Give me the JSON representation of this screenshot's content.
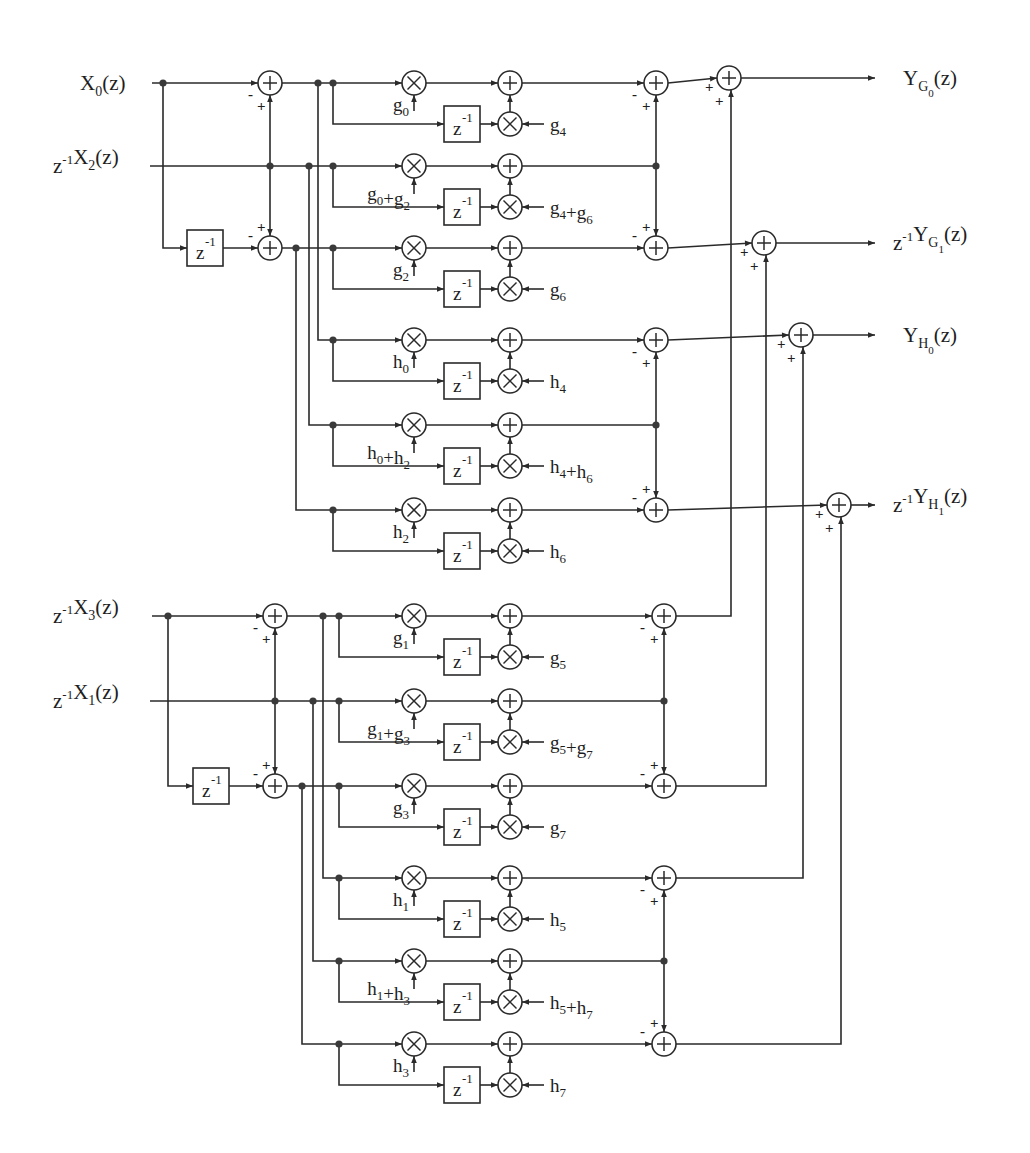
{
  "figure": {
    "type": "signal-flow block diagram"
  },
  "colors": {
    "line": "#2a2a2a",
    "background": "#ffffff",
    "text": "#1e1e1e"
  },
  "symbols": {
    "adder": "+",
    "multiplier": "×",
    "delay": "z",
    "delay_exp": "-1",
    "plus": "+",
    "minus": "-"
  },
  "inputs": [
    {
      "id": "x0",
      "prefix": "",
      "base": "X",
      "sub": "0",
      "suffix": "(z)"
    },
    {
      "id": "x2",
      "prefix": "z",
      "prefix_exp": "-1",
      "base": "X",
      "sub": "2",
      "suffix": "(z)"
    },
    {
      "id": "x3",
      "prefix": "z",
      "prefix_exp": "-1",
      "base": "X",
      "sub": "3",
      "suffix": "(z)"
    },
    {
      "id": "x1",
      "prefix": "z",
      "prefix_exp": "-1",
      "base": "X",
      "sub": "1",
      "suffix": "(z)"
    }
  ],
  "outputs": [
    {
      "id": "yg0",
      "prefix": "",
      "base": "Y",
      "sub": "G",
      "subsub": "0",
      "suffix": "(z)"
    },
    {
      "id": "yg1",
      "prefix": "z",
      "prefix_exp": "-1",
      "base": "Y",
      "sub": "G",
      "subsub": "1",
      "suffix": "(z)"
    },
    {
      "id": "yh0",
      "prefix": "",
      "base": "Y",
      "sub": "H",
      "subsub": "0",
      "suffix": "(z)"
    },
    {
      "id": "yh1",
      "prefix": "z",
      "prefix_exp": "-1",
      "base": "Y",
      "sub": "H",
      "subsub": "1",
      "suffix": "(z)"
    }
  ],
  "sections": [
    {
      "name": "upper",
      "branches": [
        {
          "coef_a": {
            "base": "g",
            "sub": "0"
          },
          "coef_b": {
            "base": "g",
            "sub": "4"
          }
        },
        {
          "coef_a": {
            "terms": [
              {
                "base": "g",
                "sub": "0"
              },
              {
                "base": "g",
                "sub": "2"
              }
            ]
          },
          "coef_b": {
            "terms": [
              {
                "base": "g",
                "sub": "4"
              },
              {
                "base": "g",
                "sub": "6"
              }
            ]
          }
        },
        {
          "coef_a": {
            "base": "g",
            "sub": "2"
          },
          "coef_b": {
            "base": "g",
            "sub": "6"
          }
        },
        {
          "coef_a": {
            "base": "h",
            "sub": "0"
          },
          "coef_b": {
            "base": "h",
            "sub": "4"
          }
        },
        {
          "coef_a": {
            "terms": [
              {
                "base": "h",
                "sub": "0"
              },
              {
                "base": "h",
                "sub": "2"
              }
            ]
          },
          "coef_b": {
            "terms": [
              {
                "base": "h",
                "sub": "4"
              },
              {
                "base": "h",
                "sub": "6"
              }
            ]
          }
        },
        {
          "coef_a": {
            "base": "h",
            "sub": "2"
          },
          "coef_b": {
            "base": "h",
            "sub": "6"
          }
        }
      ]
    },
    {
      "name": "lower",
      "branches": [
        {
          "coef_a": {
            "base": "g",
            "sub": "1"
          },
          "coef_b": {
            "base": "g",
            "sub": "5"
          }
        },
        {
          "coef_a": {
            "terms": [
              {
                "base": "g",
                "sub": "1"
              },
              {
                "base": "g",
                "sub": "3"
              }
            ]
          },
          "coef_b": {
            "terms": [
              {
                "base": "g",
                "sub": "5"
              },
              {
                "base": "g",
                "sub": "7"
              }
            ]
          }
        },
        {
          "coef_a": {
            "base": "g",
            "sub": "3"
          },
          "coef_b": {
            "base": "g",
            "sub": "7"
          }
        },
        {
          "coef_a": {
            "base": "h",
            "sub": "1"
          },
          "coef_b": {
            "base": "h",
            "sub": "5"
          }
        },
        {
          "coef_a": {
            "terms": [
              {
                "base": "h",
                "sub": "1"
              },
              {
                "base": "h",
                "sub": "3"
              }
            ]
          },
          "coef_b": {
            "terms": [
              {
                "base": "h",
                "sub": "5"
              },
              {
                "base": "h",
                "sub": "7"
              }
            ]
          }
        },
        {
          "coef_a": {
            "base": "h",
            "sub": "3"
          },
          "coef_b": {
            "base": "h",
            "sub": "7"
          }
        }
      ]
    }
  ]
}
